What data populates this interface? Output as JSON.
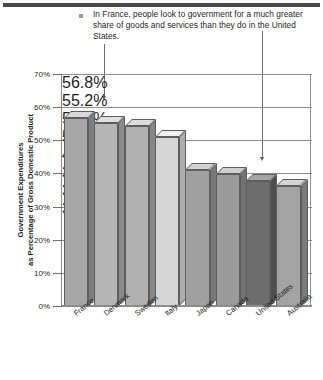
{
  "annotation": {
    "bullet": "square-bullet",
    "text": "In France, people look to government for a much greater share of goods and services than they do in the United States."
  },
  "chart_data": {
    "type": "bar",
    "title": "",
    "subtitle": "",
    "xlabel": "",
    "ylabel": "Government Expenditures as Percentage of Gross Domestic Product",
    "ylabel_line1": "Government Expenditures",
    "ylabel_line2": "as Percentage of Gross Domestic Product",
    "categories": [
      "France",
      "Denmark",
      "Sweden",
      "Italy",
      "Japan",
      "Canada",
      "United States",
      "Australia"
    ],
    "values": [
      56.8,
      55.2,
      54.4,
      51.0,
      41.0,
      39.7,
      37.8,
      36.1
    ],
    "data_labels": [
      "56.8%",
      "55.2%",
      "54.4%",
      "51.0%",
      "41.0%",
      "39.7%",
      "37.8%",
      "36.1%"
    ],
    "ylim": [
      0,
      70
    ],
    "ytick_labels": [
      "0%",
      "10%",
      "20%",
      "30%",
      "40%",
      "50%",
      "60%",
      "70%"
    ],
    "ytick_values": [
      0,
      10,
      20,
      30,
      40,
      50,
      60,
      70
    ],
    "grid": true,
    "legend": "none",
    "bar_colors": [
      "#a8a8a8",
      "#b5b5b5",
      "#b0b0b0",
      "#d6d6d6",
      "#a0a0a0",
      "#9a9a9a",
      "#6e6e6e",
      "#a3a3a3"
    ],
    "bar_top_colors": [
      "#d8d8d8",
      "#e0e0e0",
      "#dcdcdc",
      "#f0f0f0",
      "#d2d2d2",
      "#cecece",
      "#a6a6a6",
      "#d4d4d4"
    ],
    "bar_side_colors": [
      "#7e7e7e",
      "#8a8a8a",
      "#868686",
      "#aeaeae",
      "#777777",
      "#727272",
      "#4e4e4e",
      "#7b7b7b"
    ],
    "annotations": [
      {
        "name": "france-leader",
        "target": "France"
      },
      {
        "name": "united-states-leader",
        "target": "United States"
      }
    ]
  }
}
